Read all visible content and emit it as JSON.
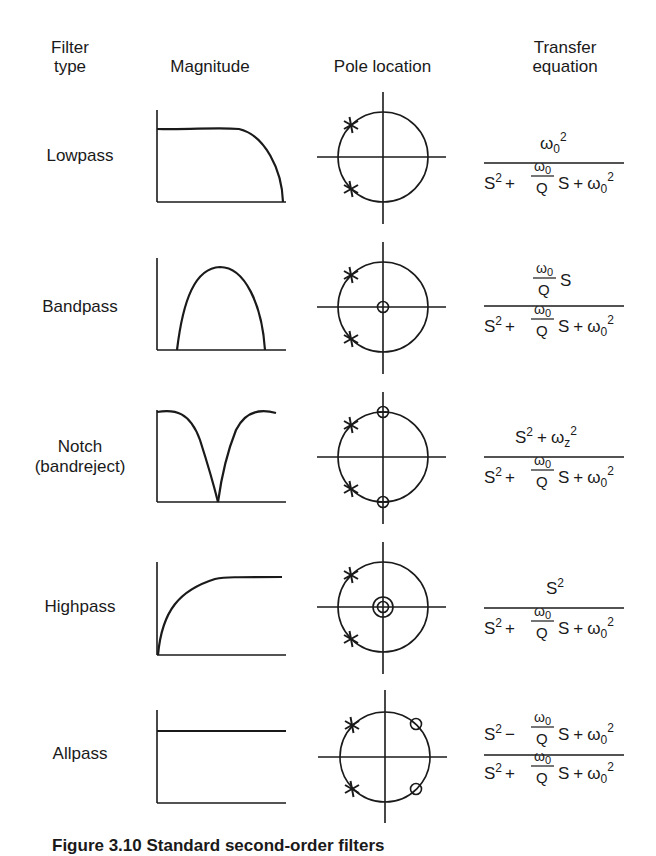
{
  "header": {
    "col_filter_type": [
      "Filter",
      "type"
    ],
    "col_magnitude": "Magnitude",
    "col_pole_location": "Pole location",
    "col_transfer_equation": [
      "Transfer",
      "equation"
    ]
  },
  "rows": [
    {
      "label": [
        "Lowpass"
      ],
      "magnitude_shape": "lowpass",
      "poles": [
        "conjugate pair, left half-plane"
      ],
      "zeros": [],
      "numerator": "ω0²",
      "denominator": "S² + (ω0/Q) S + ω0²"
    },
    {
      "label": [
        "Bandpass"
      ],
      "magnitude_shape": "bandpass",
      "poles": [
        "conjugate pair, left half-plane"
      ],
      "zeros": [
        "origin"
      ],
      "numerator": "(ω0/Q) S",
      "denominator": "S² + (ω0/Q) S + ω0²"
    },
    {
      "label": [
        "Notch",
        "(bandreject)"
      ],
      "magnitude_shape": "notch",
      "poles": [
        "conjugate pair, left half-plane"
      ],
      "zeros": [
        "+jωz",
        "-jωz"
      ],
      "numerator": "S² + ωz²",
      "denominator": "S² + (ω0/Q) S + ω0²"
    },
    {
      "label": [
        "Highpass"
      ],
      "magnitude_shape": "highpass",
      "poles": [
        "conjugate pair, left half-plane"
      ],
      "zeros": [
        "origin (double)"
      ],
      "numerator": "S²",
      "denominator": "S² + (ω0/Q) S + ω0²"
    },
    {
      "label": [
        "Allpass"
      ],
      "magnitude_shape": "allpass",
      "poles": [
        "conjugate pair, left half-plane"
      ],
      "zeros": [
        "conjugate pair, right half-plane (mirror)"
      ],
      "numerator": "S² − (ω0/Q) S + ω0²",
      "denominator": "S² + (ω0/Q) S + ω0²"
    }
  ],
  "eq_parts": {
    "omega": "ω",
    "sub0": "0",
    "subz": "z",
    "sup2": "2",
    "S": "S",
    "Q": "Q",
    "plus": "+",
    "minus": "−"
  },
  "caption": "Figure 3.10  Standard second-order filters"
}
